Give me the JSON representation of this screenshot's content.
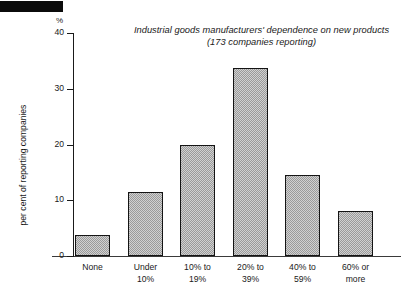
{
  "redaction": {
    "name": "masked-header-bar",
    "color": "#0b0b0b"
  },
  "chart_data": {
    "type": "bar",
    "title": "Industrial goods manufacturers' dependence on new products",
    "subtitle": "(173 companies reporting)",
    "xlabel": "",
    "ylabel": "per cent of reporting companies",
    "yunit": "%",
    "categories": [
      "None",
      "Under 10%",
      "10% to 19%",
      "20% to 39%",
      "40% to 59%",
      "60% or more"
    ],
    "category_lines": [
      [
        "None"
      ],
      [
        "Under",
        "10%"
      ],
      [
        "10% to",
        "19%"
      ],
      [
        "20% to",
        "39%"
      ],
      [
        "40% to",
        "59%"
      ],
      [
        "60% or",
        "more"
      ]
    ],
    "values": [
      3.8,
      11.5,
      20.0,
      33.8,
      14.5,
      8.0
    ],
    "ylim": [
      0,
      40
    ],
    "yticks": [
      0,
      10,
      20,
      30,
      40
    ],
    "ytick_labels": [
      "0",
      "10",
      "20",
      "30",
      "40"
    ],
    "grid": false,
    "legend": null,
    "bar_fill_color": "#9a9a9a",
    "bar_edge_color": "#141414"
  }
}
